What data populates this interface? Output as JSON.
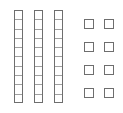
{
  "diagram": {
    "type": "base-ten-blocks",
    "tens_rods": 3,
    "units_per_rod": 10,
    "unit_cubes": 8,
    "represented_value": 38,
    "colors": {
      "stroke": "#6e6e6e",
      "inner_line": "#a0a0a0",
      "fill": "#ffffff"
    },
    "rods": [
      {
        "x": 14,
        "y": 10
      },
      {
        "x": 34,
        "y": 10
      },
      {
        "x": 54,
        "y": 10
      }
    ],
    "units": [
      {
        "x": 84,
        "y": 19
      },
      {
        "x": 104,
        "y": 19
      },
      {
        "x": 84,
        "y": 42
      },
      {
        "x": 104,
        "y": 42
      },
      {
        "x": 84,
        "y": 65
      },
      {
        "x": 104,
        "y": 65
      },
      {
        "x": 84,
        "y": 88
      },
      {
        "x": 104,
        "y": 88
      }
    ]
  }
}
